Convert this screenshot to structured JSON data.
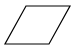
{
  "diagram": {
    "shapes": [
      {
        "type": "parallelogram",
        "role": "input-output",
        "points": [
          [
            26,
            6
          ],
          [
            70,
            6
          ],
          [
            49,
            44
          ],
          [
            5,
            44
          ]
        ],
        "stroke": "#000000",
        "fill": "#ffffff",
        "stroke_width": 1.2,
        "label": ""
      }
    ]
  }
}
